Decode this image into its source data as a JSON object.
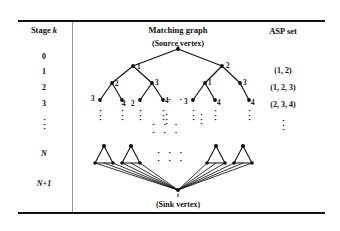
{
  "figure": {
    "columns": {
      "stage_header": "Stage k",
      "graph_header": "Matching graph",
      "asp_header": "ASP set"
    },
    "graph_captions": {
      "source": "(Source vertex)",
      "sink": "(Sink vertex)"
    },
    "vertices": {
      "source_label": "s",
      "sink_label": "t"
    },
    "stage_values": [
      "0",
      "1",
      "2",
      "3",
      "N",
      "N+1"
    ],
    "asp_values": [
      "(1, 2)",
      "(1, 2, 3)",
      "(2, 3, 4)"
    ],
    "ellipsis": {
      "vertical": "·\n·\n·",
      "dot": "·"
    },
    "tree_labels": {
      "level1": [
        "1",
        "2"
      ],
      "level2_left": [
        "2",
        "3"
      ],
      "level2_right": [
        "1",
        "3"
      ],
      "level3_left": [
        "3",
        "4",
        "2",
        "4"
      ],
      "level3_right": [
        "3",
        "4",
        "4"
      ]
    },
    "colors": {
      "ink": "#111111",
      "rule": "#111111",
      "divider": "#9a9a9a",
      "background": "#ffffff"
    }
  }
}
